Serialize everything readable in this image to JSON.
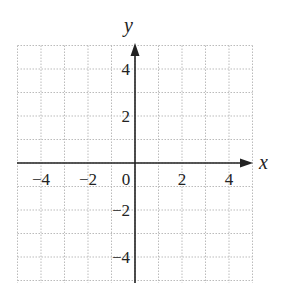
{
  "chart_data": {
    "type": "scatter",
    "title": "",
    "xlabel": "x",
    "ylabel": "y",
    "xlim": [
      -5,
      5
    ],
    "ylim": [
      -5,
      5
    ],
    "grid": true,
    "grid_step": 1,
    "x_ticks": [
      -4,
      -2,
      0,
      2,
      4
    ],
    "x_tick_labels": [
      "−4",
      "−2",
      "0",
      "2",
      "4"
    ],
    "y_ticks": [
      4,
      2,
      -2,
      -4
    ],
    "y_tick_labels": [
      "4",
      "2",
      "−2",
      "−4"
    ],
    "series": [],
    "colors": {
      "axis": "#222222",
      "grid": "#bbbbbb",
      "background": "#ffffff"
    }
  }
}
